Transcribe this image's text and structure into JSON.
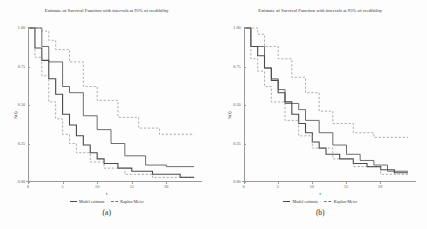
{
  "figure": {
    "background_color": "#fdfdfd",
    "curve_color": "#4a4a4a",
    "band_color": "#8c8c8c",
    "axis_color": "#9a9a9a"
  },
  "panels": [
    {
      "id": "panel-a",
      "caption": "(a)",
      "title": "Estimate of Survival Function with intervals at 95% of credibility",
      "xlabel": "t",
      "ylabel": "S(t)",
      "legend": [
        {
          "label": "Model estimate",
          "style": "solid"
        },
        {
          "label": "Kaplan-Meier",
          "style": "dashed"
        }
      ],
      "chart_data": {
        "type": "line",
        "title": "Estimate of Survival Function with intervals at 95% of credibility",
        "xlabel": "t",
        "ylabel": "S(t)",
        "xlim": [
          0,
          24
        ],
        "ylim": [
          0,
          1
        ],
        "xticks": [
          0,
          5,
          10,
          15,
          20
        ],
        "yticks": [
          0.0,
          0.25,
          0.5,
          0.75,
          1.0
        ],
        "ytick_labels": [
          "0.00",
          "0.25",
          "0.50",
          "0.75",
          "1.00"
        ],
        "grid": false,
        "legend_position": "bottom",
        "series": [
          {
            "name": "Model estimate",
            "style": "solid",
            "x": [
              0,
              1,
              1,
              2,
              2,
              3,
              3,
              4,
              4,
              5,
              5,
              6,
              6,
              7,
              7,
              8,
              8,
              9,
              9,
              10,
              10,
              11,
              11,
              13,
              13,
              15,
              15,
              18,
              18,
              22,
              22,
              24
            ],
            "y": [
              1.0,
              1.0,
              0.87,
              0.87,
              0.79,
              0.79,
              0.67,
              0.67,
              0.57,
              0.57,
              0.44,
              0.44,
              0.37,
              0.37,
              0.3,
              0.3,
              0.24,
              0.24,
              0.19,
              0.19,
              0.15,
              0.15,
              0.12,
              0.12,
              0.09,
              0.09,
              0.07,
              0.07,
              0.05,
              0.05,
              0.03,
              0.03
            ]
          },
          {
            "name": "Kaplan-Meier",
            "style": "solid-secondary",
            "x": [
              0,
              2,
              2,
              3,
              3,
              5,
              5,
              6,
              6,
              8,
              8,
              10,
              10,
              12,
              12,
              14,
              14,
              17,
              17,
              20,
              20,
              24
            ],
            "y": [
              1.0,
              1.0,
              0.88,
              0.88,
              0.78,
              0.78,
              0.62,
              0.62,
              0.58,
              0.58,
              0.43,
              0.43,
              0.34,
              0.34,
              0.25,
              0.25,
              0.17,
              0.17,
              0.11,
              0.11,
              0.1,
              0.1
            ]
          },
          {
            "name": "Upper 95% credibility band",
            "style": "dashed",
            "x": [
              0,
              2,
              2,
              3,
              3,
              4,
              4,
              6,
              6,
              8,
              8,
              10,
              10,
              13,
              13,
              16,
              16,
              19,
              19,
              24
            ],
            "y": [
              1.0,
              1.0,
              0.98,
              0.98,
              0.92,
              0.92,
              0.86,
              0.86,
              0.78,
              0.78,
              0.62,
              0.62,
              0.53,
              0.53,
              0.42,
              0.42,
              0.35,
              0.35,
              0.31,
              0.31
            ]
          },
          {
            "name": "Lower 95% credibility band",
            "style": "dashed",
            "x": [
              0,
              1,
              1,
              2,
              2,
              3,
              3,
              4,
              4,
              5,
              5,
              6,
              6,
              7,
              7,
              9,
              9,
              11,
              11,
              14,
              14,
              18,
              18,
              24
            ],
            "y": [
              1.0,
              1.0,
              0.81,
              0.81,
              0.69,
              0.69,
              0.52,
              0.52,
              0.41,
              0.41,
              0.31,
              0.31,
              0.25,
              0.25,
              0.19,
              0.19,
              0.13,
              0.13,
              0.09,
              0.09,
              0.05,
              0.05,
              0.03,
              0.03
            ]
          }
        ]
      }
    },
    {
      "id": "panel-b",
      "caption": "(b)",
      "title": "Estimate of Survival Function with intervals at 95% of credibility",
      "xlabel": "t",
      "ylabel": "S(t)",
      "legend": [
        {
          "label": "Model estimate",
          "style": "solid"
        },
        {
          "label": "Kaplan-Meier",
          "style": "dashed"
        }
      ],
      "chart_data": {
        "type": "line",
        "title": "Estimate of Survival Function with intervals at 95% of credibility",
        "xlabel": "t",
        "ylabel": "S(t)",
        "xlim": [
          0,
          24
        ],
        "ylim": [
          0,
          1
        ],
        "xticks": [
          0,
          5,
          10,
          15,
          20
        ],
        "yticks": [
          0.0,
          0.25,
          0.5,
          0.75,
          1.0
        ],
        "ytick_labels": [
          "0.00",
          "0.25",
          "0.50",
          "0.75",
          "1.00"
        ],
        "grid": false,
        "legend_position": "bottom",
        "series": [
          {
            "name": "Model estimate",
            "style": "solid",
            "x": [
              0,
              1,
              1,
              2,
              2,
              3,
              3,
              4,
              4,
              5,
              5,
              6,
              6,
              7,
              7,
              8,
              8,
              9,
              9,
              10,
              10,
              11,
              11,
              12,
              12,
              14,
              14,
              16,
              16,
              18,
              18,
              20,
              20,
              22,
              22,
              24
            ],
            "y": [
              1.0,
              1.0,
              0.88,
              0.88,
              0.82,
              0.82,
              0.74,
              0.74,
              0.66,
              0.66,
              0.58,
              0.58,
              0.52,
              0.52,
              0.44,
              0.44,
              0.38,
              0.38,
              0.32,
              0.32,
              0.26,
              0.26,
              0.22,
              0.22,
              0.18,
              0.18,
              0.15,
              0.15,
              0.12,
              0.12,
              0.1,
              0.1,
              0.08,
              0.08,
              0.06,
              0.06
            ]
          },
          {
            "name": "Kaplan-Meier",
            "style": "solid-secondary",
            "x": [
              0,
              1,
              1,
              3,
              3,
              4,
              4,
              5,
              5,
              6,
              6,
              8,
              8,
              9,
              9,
              11,
              11,
              13,
              13,
              15,
              15,
              17,
              17,
              19,
              19,
              21,
              21,
              24
            ],
            "y": [
              1.0,
              1.0,
              0.88,
              0.88,
              0.74,
              0.74,
              0.67,
              0.67,
              0.6,
              0.6,
              0.51,
              0.51,
              0.47,
              0.47,
              0.4,
              0.4,
              0.32,
              0.32,
              0.24,
              0.24,
              0.18,
              0.18,
              0.14,
              0.14,
              0.11,
              0.11,
              0.07,
              0.07
            ]
          },
          {
            "name": "Upper 95% credibility band",
            "style": "dashed",
            "x": [
              0,
              2,
              2,
              3,
              3,
              5,
              5,
              7,
              7,
              9,
              9,
              11,
              11,
              13,
              13,
              16,
              16,
              19,
              19,
              24
            ],
            "y": [
              1.0,
              1.0,
              0.96,
              0.96,
              0.88,
              0.88,
              0.8,
              0.8,
              0.68,
              0.68,
              0.58,
              0.58,
              0.46,
              0.46,
              0.38,
              0.38,
              0.32,
              0.32,
              0.29,
              0.29
            ]
          },
          {
            "name": "Lower 95% credibility band",
            "style": "dashed",
            "x": [
              0,
              1,
              1,
              2,
              2,
              3,
              3,
              4,
              4,
              6,
              6,
              8,
              8,
              10,
              10,
              13,
              13,
              16,
              16,
              20,
              20,
              24
            ],
            "y": [
              1.0,
              1.0,
              0.8,
              0.8,
              0.72,
              0.72,
              0.62,
              0.62,
              0.52,
              0.52,
              0.4,
              0.4,
              0.3,
              0.3,
              0.22,
              0.22,
              0.15,
              0.15,
              0.1,
              0.1,
              0.05,
              0.05
            ]
          }
        ]
      }
    }
  ]
}
